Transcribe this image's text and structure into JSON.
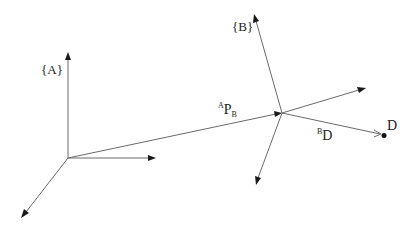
{
  "diagram": {
    "title": "",
    "background": "#ffffff",
    "line_color": "#6a6a6a",
    "arrowhead_color": "#1a1a1a",
    "frames": [
      {
        "id": "A",
        "label": "{A}",
        "origin": [
          68,
          158
        ],
        "axes": [
          {
            "name": "z",
            "to": [
              68,
              52
            ]
          },
          {
            "name": "y",
            "to": [
              156,
              158
            ]
          },
          {
            "name": "x",
            "to": [
              22,
              217
            ]
          }
        ]
      },
      {
        "id": "B",
        "label": "{B}",
        "origin": [
          282,
          113
        ],
        "axes": [
          {
            "name": "z",
            "to": [
              255,
              15
            ]
          },
          {
            "name": "y",
            "to": [
              365,
              88
            ]
          },
          {
            "name": "x",
            "to": [
              256,
              184
            ]
          }
        ]
      }
    ],
    "vectors": [
      {
        "id": "A_P_B",
        "label_sup": "A",
        "label_main": "P",
        "label_sub": "B",
        "from": [
          68,
          158
        ],
        "to": [
          282,
          113
        ]
      },
      {
        "id": "B_D",
        "label_sup": "B",
        "label_main": "D",
        "from": [
          282,
          113
        ],
        "to": [
          382,
          135
        ]
      }
    ],
    "points": [
      {
        "id": "D",
        "label": "D",
        "position": [
          384,
          136
        ]
      }
    ]
  }
}
